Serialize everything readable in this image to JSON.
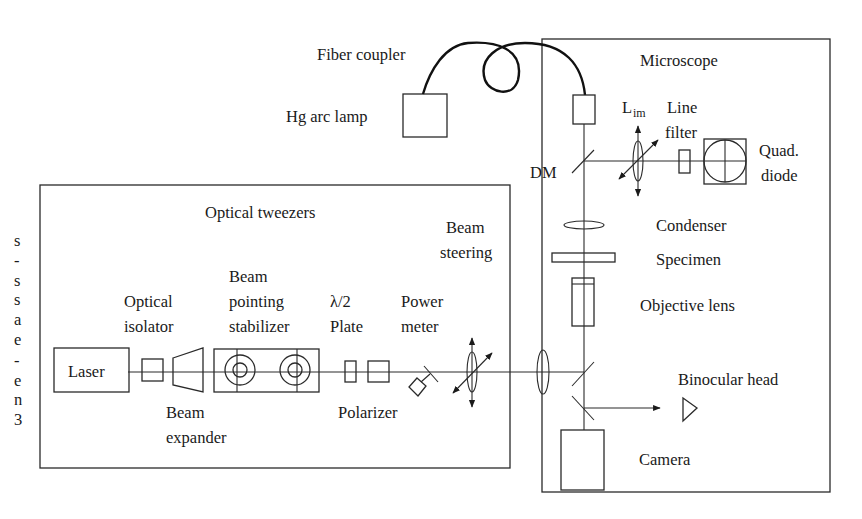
{
  "diagram": {
    "groups": {
      "optical_tweezers": "Optical tweezers",
      "microscope": "Microscope"
    },
    "labels": {
      "fiber_coupler": "Fiber coupler",
      "hg_arc_lamp": "Hg arc lamp",
      "lim_main": "L",
      "lim_sub": "im",
      "line_filter_1": "Line",
      "line_filter_2": "filter",
      "quad_diode_1": "Quad.",
      "quad_diode_2": "diode",
      "dm": "DM",
      "condenser": "Condenser",
      "specimen": "Specimen",
      "objective_lens": "Objective lens",
      "binocular_head": "Binocular head",
      "camera": "Camera",
      "beam_steering_1": "Beam",
      "beam_steering_2": "steering",
      "laser": "Laser",
      "optical_isolator_1": "Optical",
      "optical_isolator_2": "isolator",
      "beam_pointing_1": "Beam",
      "beam_pointing_2": "pointing",
      "beam_pointing_3": "stabilizer",
      "half_wave_1": "λ/2",
      "half_wave_2": "Plate",
      "power_meter_1": "Power",
      "power_meter_2": "meter",
      "beam_expander_1": "Beam",
      "beam_expander_2": "expander",
      "polarizer": "Polarizer"
    },
    "margin_text": [
      "s",
      "-",
      "s",
      "s",
      "a",
      "e",
      "-",
      "e",
      "n",
      "3"
    ]
  }
}
